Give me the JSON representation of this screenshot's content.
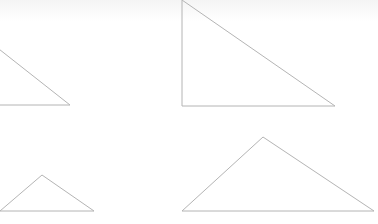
{
  "diagram": {
    "stroke_color": "#b4b4b4",
    "background": "#ffffff",
    "shapes": [
      {
        "name": "triangle-top-left",
        "points": "-10,42 70,105 -10,105"
      },
      {
        "name": "triangle-top-right",
        "points": "182,0 335,106 182,106"
      },
      {
        "name": "triangle-bottom-left",
        "points": "0,211 42,175 94,211"
      },
      {
        "name": "triangle-bottom-right",
        "points": "182,211 263,137 374,211"
      }
    ]
  }
}
